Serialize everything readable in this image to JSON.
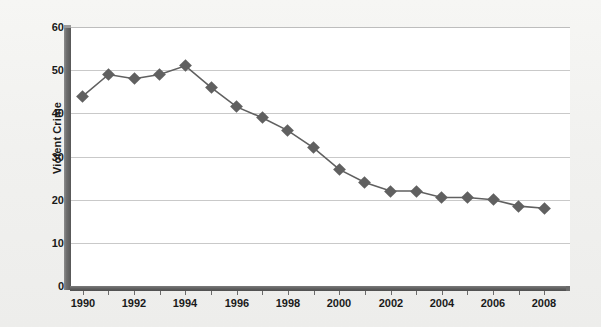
{
  "chart_data": {
    "type": "line",
    "title": "",
    "xlabel": "",
    "ylabel": "Violent Crime Victimization Rates per 1,000 Persons",
    "ylabel_lines": [
      "Violent Crime",
      "Victimization Rates per 1,000 Persons"
    ],
    "x": [
      1990,
      1991,
      1992,
      1993,
      1994,
      1995,
      1996,
      1997,
      1998,
      1999,
      2000,
      2001,
      2002,
      2003,
      2004,
      2005,
      2006,
      2007,
      2008
    ],
    "values": [
      44,
      49,
      48,
      49,
      51,
      46,
      41.5,
      39,
      36,
      32,
      27,
      24,
      22,
      22,
      20.5,
      20.5,
      20,
      18.5,
      18
    ],
    "xlim": [
      1989.5,
      2009.0
    ],
    "ylim": [
      0,
      60
    ],
    "ytick_labels": [
      "60",
      "50",
      "40",
      "30",
      "20",
      "10",
      "0"
    ],
    "ytick_values": [
      60,
      50,
      40,
      30,
      20,
      10,
      0
    ],
    "xtick_labels": [
      "1990",
      "1992",
      "1994",
      "1996",
      "1998",
      "2000",
      "2002",
      "2004",
      "2006",
      "2008"
    ],
    "xtick_values": [
      1990,
      1992,
      1994,
      1996,
      1998,
      2000,
      2002,
      2004,
      2006,
      2008
    ],
    "xminor_values": [
      1991,
      1993,
      1995,
      1997,
      1999,
      2001,
      2003,
      2005,
      2007
    ],
    "grid": "horizontal",
    "legend": "none",
    "marker": "diamond",
    "series_color": "#606060",
    "grid_color": "#c9c9c9",
    "axis_color": "#5c5c5c",
    "plot_background": "#ffffff",
    "page_background": "#f1f1ef",
    "text_color": "#1a1a1a"
  }
}
